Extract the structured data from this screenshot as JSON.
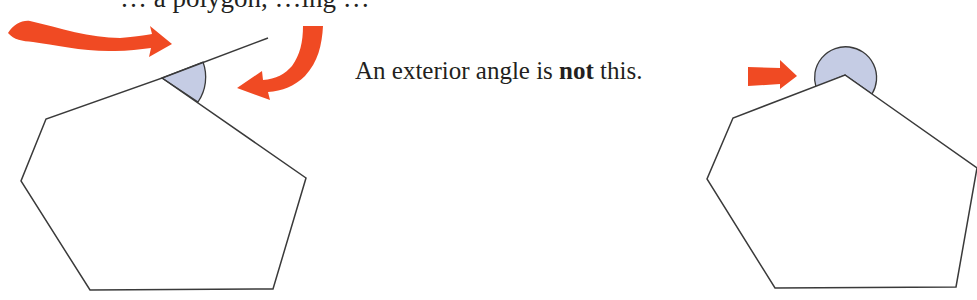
{
  "top_text_fragment": "… a polygon, …ing …",
  "caption": {
    "before": "An exterior angle is ",
    "emphasis": "not",
    "after": " this."
  },
  "colors": {
    "arrow": "#f04a23",
    "angle_fill": "#c5cce4",
    "outline": "#3a3a3a"
  },
  "figures": [
    {
      "id": "left",
      "description": "Polygon with one side extended; exterior angle shaded between extension and adjacent side",
      "correct": true
    },
    {
      "id": "right",
      "description": "Polygon with reflex angle shaded outside vertex",
      "correct": false
    }
  ]
}
